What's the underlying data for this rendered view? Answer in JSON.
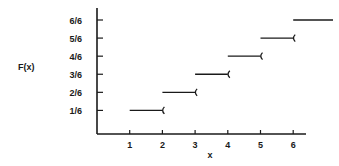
{
  "chart_data": {
    "type": "line",
    "subtype": "step-cdf",
    "title": "",
    "xlabel": "x",
    "ylabel": "F(x)",
    "x_ticks": [
      "1",
      "2",
      "3",
      "4",
      "5",
      "6"
    ],
    "y_ticks": [
      "1/6",
      "2/6",
      "3/6",
      "4/6",
      "5/6",
      "6/6"
    ],
    "grid": false,
    "legend": null,
    "steps": [
      {
        "x_start": 1,
        "x_end": 2,
        "y": 0.1667,
        "y_label": "1/6",
        "open_right": true
      },
      {
        "x_start": 2,
        "x_end": 3,
        "y": 0.3333,
        "y_label": "2/6",
        "open_right": true
      },
      {
        "x_start": 3,
        "x_end": 4,
        "y": 0.5,
        "y_label": "3/6",
        "open_right": true
      },
      {
        "x_start": 4,
        "x_end": 5,
        "y": 0.6667,
        "y_label": "4/6",
        "open_right": true
      },
      {
        "x_start": 5,
        "x_end": 6,
        "y": 0.8333,
        "y_label": "5/6",
        "open_right": true
      },
      {
        "x_start": 6,
        "x_end": 7,
        "y": 1.0,
        "y_label": "6/6",
        "open_right": false
      }
    ],
    "xlim": [
      0,
      7
    ],
    "ylim": [
      0,
      1
    ]
  },
  "labels": {
    "ylabel": "F(x)",
    "xlabel": "x"
  }
}
